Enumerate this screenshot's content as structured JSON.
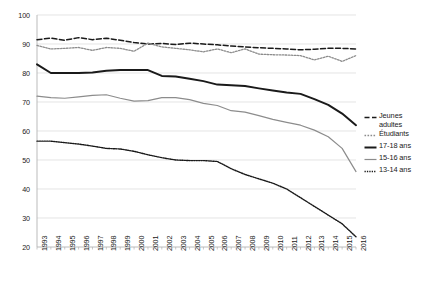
{
  "chart_data": {
    "type": "line",
    "title": "",
    "subtitle": "",
    "xlabel": "",
    "ylabel": "",
    "xlim": [
      1993,
      2016
    ],
    "ylim": [
      20,
      100
    ],
    "ytick_values": [
      20,
      30,
      40,
      50,
      60,
      70,
      80,
      90,
      100
    ],
    "grid": "horizontal",
    "legend_position": "right",
    "categories": [
      "1993",
      "1994",
      "1995",
      "1996",
      "1997",
      "1998",
      "1999",
      "2000",
      "2001",
      "2002",
      "2003",
      "2004",
      "2005",
      "2006",
      "2007",
      "2008",
      "2009",
      "2010",
      "2011",
      "2012",
      "2013",
      "2014",
      "2015",
      "2016"
    ],
    "series": [
      {
        "name": "Jeunes adultes",
        "style": "dashed",
        "color": "#1a1a1a",
        "width": 1.5,
        "values": [
          91.5,
          92.0,
          91.3,
          92.2,
          91.5,
          92.0,
          91.3,
          90.5,
          90.0,
          90.2,
          89.8,
          90.3,
          90.0,
          89.7,
          89.3,
          89.0,
          88.7,
          88.5,
          88.3,
          88.0,
          88.2,
          88.5,
          88.5,
          88.3
        ]
      },
      {
        "name": "Étudiants",
        "style": "dotted-fine",
        "color": "#8c8c8c",
        "width": 1.3,
        "values": [
          89.5,
          88.3,
          88.5,
          88.8,
          87.8,
          88.8,
          88.5,
          87.5,
          90.3,
          89.0,
          88.5,
          88.0,
          87.3,
          88.3,
          87.0,
          88.3,
          86.5,
          86.3,
          86.2,
          86.0,
          84.5,
          85.8,
          84.0,
          86.0
        ]
      },
      {
        "name": "17-18 ans",
        "style": "solid",
        "color": "#1a1a1a",
        "width": 2.0,
        "values": [
          83.0,
          80.0,
          80.0,
          80.0,
          80.2,
          80.8,
          81.0,
          81.0,
          81.0,
          79.0,
          78.8,
          78.0,
          77.2,
          76.0,
          75.8,
          75.5,
          74.7,
          74.0,
          73.3,
          72.8,
          71.0,
          69.0,
          66.0,
          62.0
        ]
      },
      {
        "name": "15-16 ans",
        "style": "solid-thin",
        "color": "#8c8c8c",
        "width": 1.2,
        "values": [
          72.0,
          71.5,
          71.3,
          71.8,
          72.3,
          72.5,
          71.3,
          70.3,
          70.5,
          71.5,
          71.5,
          70.8,
          69.5,
          68.8,
          67.0,
          66.5,
          65.3,
          64.0,
          63.0,
          62.0,
          60.3,
          58.0,
          54.0,
          46.0
        ]
      },
      {
        "name": "13-14 ans",
        "style": "dotted-dense",
        "color": "#1a1a1a",
        "width": 1.4,
        "values": [
          56.5,
          56.5,
          56.0,
          55.5,
          54.8,
          54.0,
          53.8,
          53.0,
          51.8,
          50.8,
          50.0,
          49.8,
          49.8,
          49.5,
          47.0,
          45.0,
          43.5,
          42.0,
          40.0,
          37.0,
          34.0,
          31.0,
          28.0,
          23.5
        ]
      }
    ],
    "legend_entries": [
      {
        "label": "Jeunes\nadultes",
        "style": "dashed"
      },
      {
        "label": "Étudiants",
        "style": "dotted-fine"
      },
      {
        "label": "17-18 ans",
        "style": "solid"
      },
      {
        "label": "15-16 ans",
        "style": "solid-thin"
      },
      {
        "label": "13-14 ans",
        "style": "dotted-dense"
      }
    ]
  },
  "colors": {
    "axis": "#b3b3b3",
    "grid": "#d9d9d9",
    "text": "#1a1a1a",
    "dark_series": "#1a1a1a",
    "light_series": "#8c8c8c",
    "background": "#ffffff"
  }
}
